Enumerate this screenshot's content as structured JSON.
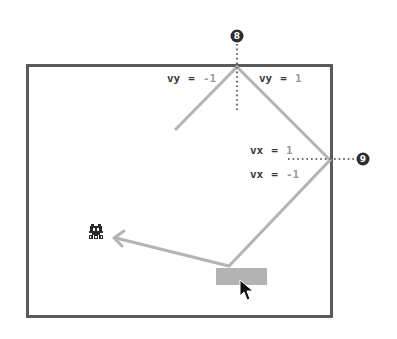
{
  "diagram": {
    "colors": {
      "frame": "#5a5a5a",
      "path": "#b4b4b4",
      "paddle": "#b3b3b3",
      "dotted": "#6a6a6a",
      "badge": "#2e2e2e",
      "label_key": "#3a3a3a",
      "label_value": "#9a9a9a"
    },
    "labels": {
      "top_left": {
        "key": "vy",
        "eq": "=",
        "value": "-1"
      },
      "top_right": {
        "key": "vy",
        "eq": "=",
        "value": "1"
      },
      "right_upper": {
        "key": "vx",
        "eq": "=",
        "value": "1"
      },
      "right_lower": {
        "key": "vx",
        "eq": "=",
        "value": "-1"
      }
    },
    "badges": [
      {
        "id": "top-wall",
        "number": "8"
      },
      {
        "id": "right-wall",
        "number": "9"
      }
    ],
    "icons": {
      "sprite": "space-invader-alien-icon",
      "cursor": "mouse-pointer-icon",
      "paddle": "paddle"
    }
  }
}
